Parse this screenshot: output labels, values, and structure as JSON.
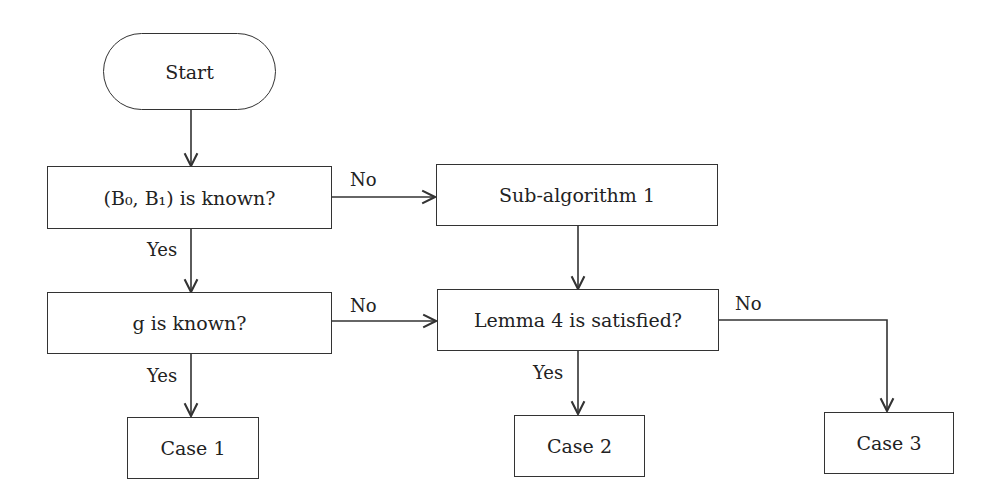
{
  "nodes": {
    "start": "Start",
    "q1": "(B₀, B₁) is known?",
    "sub1": "Sub-algorithm 1",
    "q2": "g is known?",
    "lemma": "Lemma 4 is satisfied?",
    "case1": "Case 1",
    "case2": "Case 2",
    "case3": "Case 3"
  },
  "edges": {
    "q1_no": "No",
    "q1_yes": "Yes",
    "q2_no": "No",
    "q2_yes": "Yes",
    "lemma_no": "No",
    "lemma_yes": "Yes"
  }
}
